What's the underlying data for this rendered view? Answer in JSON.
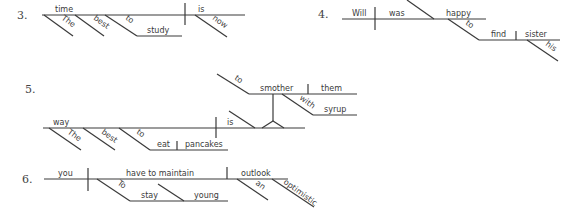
{
  "diagrams": [
    {
      "number": "3.",
      "words": {
        "subject": "time",
        "mod1": "The",
        "mod2": "best",
        "inf_to": "to",
        "inf_verb": "study",
        "verb": "is",
        "adverb": "now"
      }
    },
    {
      "number": "4.",
      "words": {
        "subject": "Will",
        "verb": "was",
        "complement": "happy",
        "inf_to": "to",
        "inf_verb": "find",
        "object": "sister",
        "mod": "his"
      }
    },
    {
      "number": "5.",
      "words": {
        "subject": "way",
        "mod1": "The",
        "mod2": "best",
        "inf_to": "to",
        "inf_verb": "eat",
        "inf_object": "pancakes",
        "verb": "is",
        "pn_to": "to",
        "pn_verb": "smother",
        "pn_object": "them",
        "prep": "with",
        "prep_object": "syrup"
      }
    },
    {
      "number": "6.",
      "words": {
        "subject": "you",
        "verb": "have to maintain",
        "object": "outlook",
        "inf_to": "To",
        "inf_verb": "stay",
        "inf_complement": "young",
        "mod1": "an",
        "mod2": "optimistic"
      }
    }
  ]
}
